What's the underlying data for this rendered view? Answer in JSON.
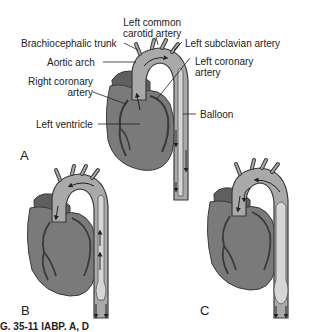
{
  "figure": {
    "panels": [
      {
        "id": "A",
        "label": "A",
        "description": "Balloon deflated during systole, blood flows from left ventricle into aorta"
      },
      {
        "id": "B",
        "label": "B",
        "description": "Balloon deflation"
      },
      {
        "id": "C",
        "label": "C",
        "description": "Balloon inflated during diastole"
      }
    ],
    "labels": {
      "left_common_carotid": "Left common\ncarotid artery",
      "left_common_carotid_1": "Left common",
      "left_common_carotid_2": "carotid artery",
      "brachiocephalic_trunk": "Brachiocephalic trunk",
      "left_subclavian": "Left subclavian artery",
      "aortic_arch": "Aortic arch",
      "left_coronary_1": "Left coronary",
      "left_coronary_2": "artery",
      "right_coronary_1": "Right coronary",
      "right_coronary_2": "artery",
      "left_ventricle": "Left ventricle",
      "balloon": "Balloon"
    },
    "caption_partial": "G. 35-11 IABP. A, D",
    "colors": {
      "heart": "#7a7a7a",
      "heart_dark": "#5f5f5f",
      "aorta": "#a9a9a9",
      "balloon": "#d6d6d6",
      "outline": "#3a3a3a",
      "leader": "#222222"
    }
  }
}
